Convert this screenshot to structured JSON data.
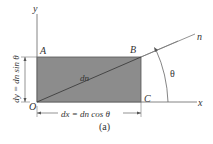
{
  "figure": {
    "caption": "(a)",
    "axes": {
      "x_label": "x",
      "y_label": "y"
    },
    "points": {
      "A": "A",
      "B": "B",
      "C": "C",
      "O": "O"
    },
    "diagonal_label": "dn",
    "normal_label": "n",
    "angle_label": "θ",
    "dimension_x": "dx = dn cos θ",
    "dimension_y": "dy = dn sin θ",
    "colors": {
      "fill": "#8c8c8c",
      "stroke": "#555555",
      "text": "#333333"
    }
  }
}
